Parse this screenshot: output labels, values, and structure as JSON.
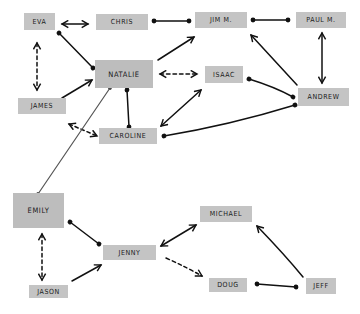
{
  "diagram": {
    "type": "social-network",
    "nodes": [
      {
        "id": "eva",
        "label": "EVA",
        "x": 24,
        "y": 13,
        "w": 31,
        "h": 17
      },
      {
        "id": "chris",
        "label": "CHRIS",
        "x": 96,
        "y": 14,
        "w": 52,
        "h": 16
      },
      {
        "id": "jim",
        "label": "JIM M.",
        "x": 195,
        "y": 12,
        "w": 52,
        "h": 16
      },
      {
        "id": "paul",
        "label": "PAUL M.",
        "x": 296,
        "y": 12,
        "w": 50,
        "h": 16
      },
      {
        "id": "natalie",
        "label": "NATALIE",
        "x": 95,
        "y": 60,
        "w": 58,
        "h": 28
      },
      {
        "id": "isaac",
        "label": "ISAAC",
        "x": 205,
        "y": 66,
        "w": 38,
        "h": 17
      },
      {
        "id": "andrew",
        "label": "ANDREW",
        "x": 298,
        "y": 88,
        "w": 51,
        "h": 18
      },
      {
        "id": "james",
        "label": "JAMES",
        "x": 18,
        "y": 98,
        "w": 48,
        "h": 16
      },
      {
        "id": "caroline",
        "label": "CAROLINE",
        "x": 99,
        "y": 128,
        "w": 58,
        "h": 16
      },
      {
        "id": "emily",
        "label": "EMILY",
        "x": 13,
        "y": 193,
        "w": 51,
        "h": 35
      },
      {
        "id": "jenny",
        "label": "JENNY",
        "x": 103,
        "y": 245,
        "w": 53,
        "h": 15
      },
      {
        "id": "michael",
        "label": "MICHAEL",
        "x": 200,
        "y": 206,
        "w": 52,
        "h": 16
      },
      {
        "id": "jason",
        "label": "JASON",
        "x": 29,
        "y": 285,
        "w": 39,
        "h": 13
      },
      {
        "id": "doug",
        "label": "DOUG",
        "x": 209,
        "y": 278,
        "w": 38,
        "h": 14
      },
      {
        "id": "jeff",
        "label": "JEFF",
        "x": 306,
        "y": 278,
        "w": 30,
        "h": 16
      }
    ],
    "edges": [
      {
        "from": "eva",
        "to": "chris",
        "style": "solid",
        "ends": "arrow-both",
        "path": "M62,24 L88,24"
      },
      {
        "from": "eva",
        "to": "natalie",
        "style": "solid",
        "ends": "dot-both",
        "path": "M59,33 L93,68"
      },
      {
        "from": "eva",
        "to": "james",
        "style": "dashed",
        "ends": "arrow-both",
        "path": "M37,43 L37,90"
      },
      {
        "from": "james",
        "to": "natalie",
        "style": "solid",
        "ends": "arrow-end",
        "path": "M62,98 L92,80"
      },
      {
        "from": "james",
        "to": "caroline",
        "style": "dashed",
        "ends": "arrow-both",
        "path": "M69,124 L97,136"
      },
      {
        "from": "chris",
        "to": "jim",
        "style": "solid",
        "ends": "dot-both",
        "path": "M154,21 L189,21"
      },
      {
        "from": "jim",
        "to": "paul",
        "style": "solid",
        "ends": "dot-both",
        "path": "M253,20 L288,20"
      },
      {
        "from": "natalie",
        "to": "jim",
        "style": "solid",
        "ends": "arrow-end",
        "path": "M158,60 L194,37"
      },
      {
        "from": "natalie",
        "to": "isaac",
        "style": "dashed",
        "ends": "arrow-both",
        "path": "M160,74 L197,74"
      },
      {
        "from": "natalie",
        "to": "caroline",
        "style": "solid",
        "ends": "dot-both",
        "path": "M127,90 L129,127"
      },
      {
        "from": "natalie",
        "to": "emily",
        "style": "gray",
        "ends": "dot-both",
        "path": "M110,88 L38,194"
      },
      {
        "from": "caroline",
        "to": "isaac",
        "style": "solid",
        "ends": "arrow-both",
        "path": "M161,126 L201,90"
      },
      {
        "from": "caroline",
        "to": "andrew",
        "style": "solid",
        "ends": "dot-both",
        "path": "M164,136 Q230,125 295,105"
      },
      {
        "from": "isaac",
        "to": "andrew",
        "style": "solid",
        "ends": "dot-both",
        "path": "M249,79 Q275,87 293,97"
      },
      {
        "from": "andrew",
        "to": "jim",
        "style": "solid",
        "ends": "arrow-end",
        "path": "M297,85 L251,35"
      },
      {
        "from": "andrew",
        "to": "paul",
        "style": "solid",
        "ends": "arrow-both",
        "path": "M322,83 L322,33"
      },
      {
        "from": "emily",
        "to": "jason",
        "style": "dashed",
        "ends": "arrow-both",
        "path": "M42,234 L42,280"
      },
      {
        "from": "emily",
        "to": "jenny",
        "style": "solid",
        "ends": "dot-both",
        "path": "M70,222 L99,244"
      },
      {
        "from": "jason",
        "to": "jenny",
        "style": "solid",
        "ends": "arrow-end",
        "path": "M72,281 L101,265"
      },
      {
        "from": "jenny",
        "to": "michael",
        "style": "solid",
        "ends": "arrow-both",
        "path": "M161,246 L196,225"
      },
      {
        "from": "jenny",
        "to": "doug",
        "style": "dashed",
        "ends": "arrow-end",
        "path": "M166,258 Q188,268 202,276"
      },
      {
        "from": "doug",
        "to": "jeff",
        "style": "solid",
        "ends": "dot-both",
        "path": "M257,284 L296,287"
      },
      {
        "from": "jeff",
        "to": "michael",
        "style": "solid",
        "ends": "arrow-end",
        "path": "M303,277 Q285,255 257,226"
      }
    ]
  }
}
